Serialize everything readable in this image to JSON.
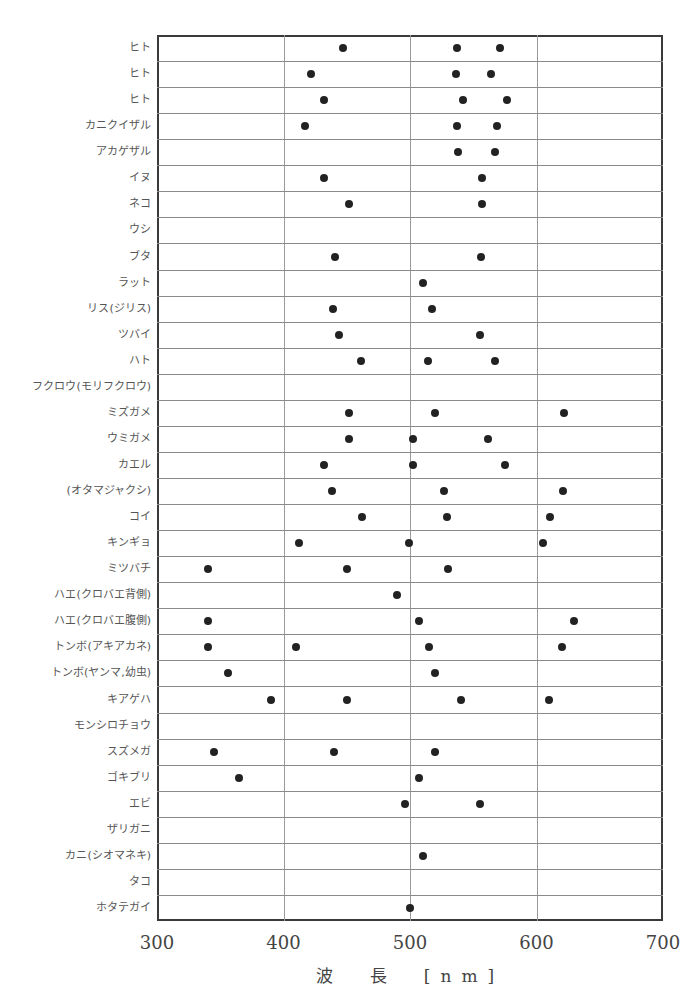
{
  "chart_data": {
    "type": "scatter",
    "title": "",
    "xlabel": "波 長 [nm]",
    "ylabel": "",
    "xlim": [
      300,
      700
    ],
    "xticks": [
      300,
      400,
      500,
      600,
      700
    ],
    "grid": true,
    "rows": [
      {
        "label": "ヒト",
        "values": [
          447,
          537,
          571
        ]
      },
      {
        "label": "ヒト",
        "values": [
          422,
          536,
          564
        ]
      },
      {
        "label": "ヒト",
        "values": [
          432,
          542,
          577
        ]
      },
      {
        "label": "カニクイザル",
        "values": [
          417,
          537,
          569
        ]
      },
      {
        "label": "アカゲザル",
        "values": [
          538,
          567
        ]
      },
      {
        "label": "イヌ",
        "values": [
          432,
          557
        ]
      },
      {
        "label": "ネコ",
        "values": [
          452,
          557
        ]
      },
      {
        "label": "ウシ",
        "values": []
      },
      {
        "label": "ブタ",
        "values": [
          441,
          556
        ]
      },
      {
        "label": "ラット",
        "values": [
          510
        ]
      },
      {
        "label": "リス(ジリス)",
        "values": [
          439,
          517
        ]
      },
      {
        "label": "ツバイ",
        "values": [
          444,
          555
        ]
      },
      {
        "label": "ハト",
        "values": [
          461,
          514,
          567
        ]
      },
      {
        "label": "フクロウ(モリフクロウ)",
        "values": []
      },
      {
        "label": "ミズガメ",
        "values": [
          452,
          520,
          622
        ]
      },
      {
        "label": "ウミガメ",
        "values": [
          452,
          502,
          562
        ]
      },
      {
        "label": "カエル",
        "values": [
          432,
          502,
          575
        ]
      },
      {
        "label": "(オタマジャクシ)",
        "values": [
          438,
          527,
          621
        ]
      },
      {
        "label": "コイ",
        "values": [
          462,
          529,
          611
        ]
      },
      {
        "label": "キンギョ",
        "values": [
          412,
          499,
          605
        ]
      },
      {
        "label": "ミツバチ",
        "values": [
          340,
          450,
          530
        ]
      },
      {
        "label": "ハエ(クロバエ背側)",
        "values": [
          490
        ]
      },
      {
        "label": "ハエ(クロバエ腹側)",
        "values": [
          340,
          507,
          630
        ]
      },
      {
        "label": "トンボ(アキアカネ)",
        "values": [
          340,
          410,
          515,
          620
        ]
      },
      {
        "label": "トンボ(ヤンマ,幼虫)",
        "values": [
          356,
          520
        ]
      },
      {
        "label": "キアゲハ",
        "values": [
          390,
          450,
          540,
          610
        ]
      },
      {
        "label": "モンシロチョウ",
        "values": []
      },
      {
        "label": "スズメガ",
        "values": [
          345,
          440,
          520
        ]
      },
      {
        "label": "ゴキブリ",
        "values": [
          365,
          507
        ]
      },
      {
        "label": "エビ",
        "values": [
          496,
          555
        ]
      },
      {
        "label": "ザリガニ",
        "values": []
      },
      {
        "label": "カニ(シオマネキ)",
        "values": [
          510
        ]
      },
      {
        "label": "タコ",
        "values": []
      },
      {
        "label": "ホタテガイ",
        "values": [
          500
        ]
      }
    ]
  },
  "axis": {
    "x_tick_labels": [
      "300",
      "400",
      "500",
      "600",
      "700"
    ],
    "x_title": "波　長　[nm]"
  }
}
